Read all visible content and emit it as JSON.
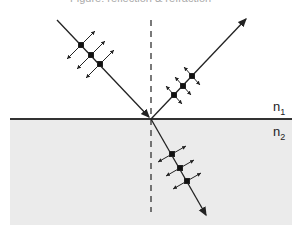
{
  "caption": "Figure: reflection & refraction",
  "media": {
    "upper": {
      "label": "n",
      "subscript": "1"
    },
    "lower": {
      "label": "n",
      "subscript": "2",
      "fill": "#ebebeb"
    }
  },
  "colors": {
    "line": "#222222",
    "interface": "#333333",
    "normal": "#333333"
  },
  "rays": [
    {
      "name": "incident",
      "from": [
        57,
        20
      ],
      "to": [
        151,
        119
      ]
    },
    {
      "name": "reflected",
      "from": [
        151,
        119
      ],
      "to": [
        247,
        18
      ]
    },
    {
      "name": "refracted",
      "from": [
        151,
        119
      ],
      "to": [
        207,
        217
      ]
    }
  ]
}
